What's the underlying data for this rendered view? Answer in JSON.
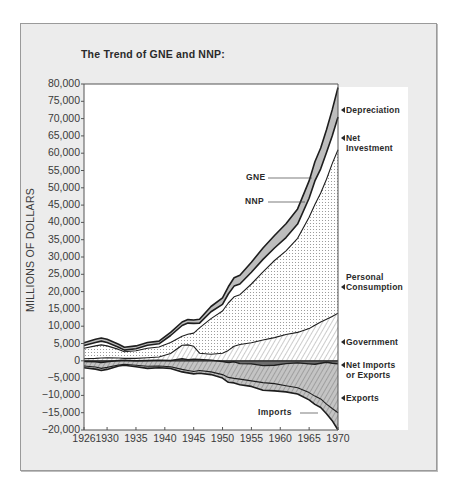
{
  "title": "The Trend of GNE and NNP:",
  "ylabel": "MILLIONS OF DOLLARS",
  "colors": {
    "panel_bg": "#ececec",
    "depreciation": "#bdbdbd",
    "consumption_dots": "#8a8a8a",
    "government_hatch": "#9a9a9a",
    "exports_fill": "#c4c4c4",
    "net_fill": "#6e6e6e",
    "line": "#1e1e1e"
  },
  "labels": {
    "gne": "GNE",
    "nnp": "NNP",
    "imports": "Imports"
  },
  "legend": [
    {
      "line1": "Depreciation",
      "line2": ""
    },
    {
      "line1": "Net",
      "line2": "Investment"
    },
    {
      "line1": "Personal",
      "line2": "Consumption"
    },
    {
      "line1": "Government",
      "line2": ""
    },
    {
      "line1": "Net Imports",
      "line2": "or Exports"
    },
    {
      "line1": "Exports",
      "line2": ""
    }
  ],
  "chart_data": {
    "type": "area",
    "title": "The Trend of GNE and NNP:",
    "xlabel": "",
    "ylabel": "MILLIONS OF DOLLARS",
    "xlim": [
      1926,
      1970
    ],
    "ylim": [
      -20000,
      80000
    ],
    "yticks": [
      80000,
      75000,
      70000,
      65000,
      60000,
      55000,
      50000,
      45000,
      40000,
      35000,
      30000,
      25000,
      20000,
      15000,
      10000,
      5000,
      0,
      -5000,
      -10000,
      -15000,
      -20000
    ],
    "ytick_labels": [
      "80,000",
      "75,000",
      "70,000",
      "65,000",
      "60,000",
      "55,000",
      "50,000",
      "45,000",
      "40,000",
      "35,000",
      "30,000",
      "25,000",
      "20,000",
      "15,000",
      "10,000",
      "5,000",
      "0",
      "−5,000",
      "−10,000",
      "−15,000",
      "−20,000"
    ],
    "xticks": [
      1926,
      1930,
      1935,
      1940,
      1945,
      1950,
      1955,
      1960,
      1965,
      1970
    ],
    "grid": false,
    "legend_position": "right",
    "x": [
      1926,
      1928,
      1929,
      1930,
      1932,
      1933,
      1935,
      1937,
      1939,
      1941,
      1943,
      1944,
      1945,
      1946,
      1948,
      1950,
      1951,
      1952,
      1953,
      1955,
      1957,
      1959,
      1961,
      1963,
      1965,
      1966,
      1967,
      1968,
      1969,
      1970
    ],
    "series": [
      {
        "name": "GNE",
        "values": [
          5200,
          6200,
          6600,
          6200,
          4800,
          3900,
          4300,
          5300,
          5700,
          8200,
          11200,
          11900,
          11800,
          12000,
          15700,
          18200,
          21400,
          24000,
          24700,
          28500,
          32600,
          36200,
          39600,
          43900,
          52000,
          57500,
          61500,
          66800,
          72500,
          79000
        ]
      },
      {
        "name": "NNP",
        "values": [
          4400,
          5300,
          5700,
          5300,
          3900,
          3100,
          3500,
          4500,
          4900,
          7300,
          10200,
          10900,
          10800,
          10900,
          14200,
          16300,
          19300,
          21600,
          22200,
          25600,
          29300,
          32600,
          35600,
          39500,
          47000,
          52000,
          55500,
          60200,
          65000,
          70500
        ]
      },
      {
        "name": "Personal Consumption",
        "values": [
          3600,
          4300,
          4600,
          4300,
          3300,
          2600,
          2900,
          3600,
          4000,
          5300,
          7100,
          7700,
          8000,
          9500,
          12200,
          14400,
          16700,
          18500,
          19100,
          22200,
          25700,
          29000,
          31800,
          35400,
          41500,
          45200,
          48500,
          52500,
          57000,
          61000
        ]
      },
      {
        "name": "Government",
        "values": [
          600,
          700,
          800,
          900,
          800,
          700,
          700,
          900,
          1100,
          2100,
          4500,
          4600,
          4200,
          2200,
          1900,
          2200,
          3000,
          4200,
          4700,
          5200,
          6000,
          6700,
          7600,
          8200,
          9300,
          10300,
          11200,
          12000,
          12800,
          13800
        ]
      },
      {
        "name": "Net Imports or Exports",
        "values": [
          -200,
          -300,
          -500,
          -300,
          100,
          200,
          0,
          100,
          200,
          100,
          600,
          300,
          500,
          400,
          200,
          -200,
          -500,
          -300,
          -800,
          -900,
          -1400,
          -1300,
          -800,
          -600,
          -900,
          -1000,
          -700,
          -400,
          -700,
          -900
        ]
      },
      {
        "name": "Exports (below zero, magnitude)",
        "values": [
          -1500,
          -1800,
          -2200,
          -1900,
          -1200,
          -1000,
          -1300,
          -1600,
          -1500,
          -1700,
          -2500,
          -2800,
          -3100,
          -2800,
          -3200,
          -4000,
          -4800,
          -5100,
          -5300,
          -5800,
          -6300,
          -6600,
          -7200,
          -7800,
          -9200,
          -10200,
          -11000,
          -12500,
          -13800,
          -15000
        ]
      },
      {
        "name": "Imports",
        "values": [
          -2000,
          -2400,
          -2800,
          -2500,
          -1500,
          -1300,
          -1700,
          -2200,
          -2000,
          -2200,
          -3200,
          -3500,
          -3800,
          -3600,
          -4000,
          -5000,
          -6200,
          -6400,
          -6900,
          -7400,
          -8500,
          -8700,
          -9000,
          -9600,
          -11300,
          -12600,
          -13500,
          -15300,
          -17300,
          -20000
        ]
      }
    ]
  }
}
